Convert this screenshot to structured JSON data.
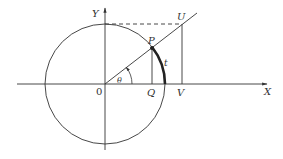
{
  "diagram": {
    "labels": {
      "y_axis": "Y",
      "x_axis": "X",
      "origin": "0",
      "point_p": "P",
      "point_q": "Q",
      "point_u": "U",
      "point_v": "V",
      "angle": "θ",
      "arc": "t"
    },
    "colors": {
      "stroke": "#333333",
      "background": "#ffffff"
    }
  }
}
